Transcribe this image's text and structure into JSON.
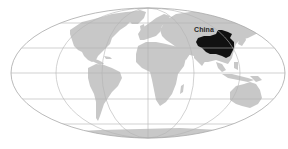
{
  "map": {
    "projection": "mollweide",
    "colors": {
      "background": "#ffffff",
      "land": "#c8c8c8",
      "highlight": "#111111",
      "graticule": "#b4b4b4",
      "outline": "#a8a8a8",
      "label": "#2a2a2a"
    },
    "highlighted_regions": [
      {
        "name": "China",
        "label": "China"
      }
    ],
    "labels": {
      "china": "China"
    }
  }
}
